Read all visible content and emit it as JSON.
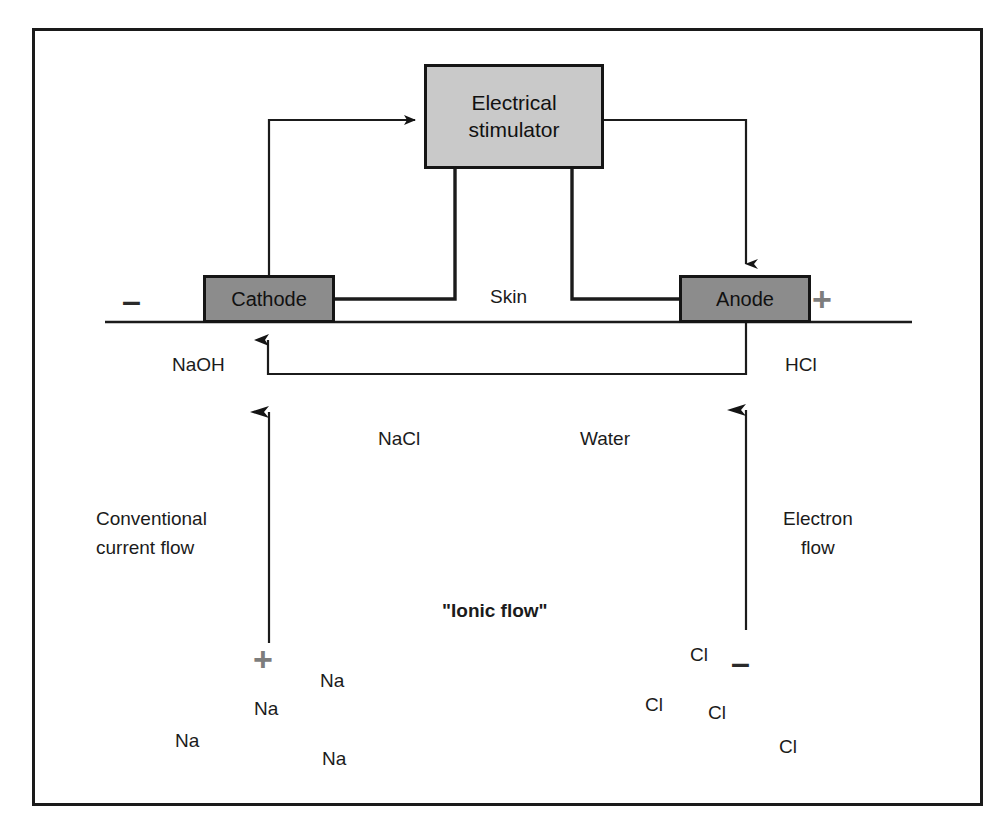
{
  "diagram": {
    "boxes": {
      "stimulator": {
        "label": "Electrical\nstimulator",
        "fill": "#c9c9c9",
        "stroke": "#151515"
      },
      "cathode": {
        "label": "Cathode",
        "fill": "#8c8c8c",
        "stroke": "#151515"
      },
      "anode": {
        "label": "Anode",
        "fill": "#8c8c8c",
        "stroke": "#151515"
      }
    },
    "labels": {
      "skin": "Skin",
      "naoh": "NaOH",
      "hcl": "HCl",
      "nacl": "NaCl",
      "water": "Water",
      "conventional_current_flow": "Conventional\ncurrent flow",
      "electron_flow": "Electron\nflow",
      "ionic_flow": "\"Ionic flow\""
    },
    "signs": {
      "cathode_polarity": "–",
      "anode_polarity": "+",
      "sodium_charge": "+",
      "chloride_charge": "–"
    },
    "ions": {
      "sodium": [
        "Na",
        "Na",
        "Na",
        "Na"
      ],
      "chloride": [
        "Cl",
        "Cl",
        "Cl",
        "Cl"
      ]
    },
    "colors": {
      "line": "#1b1b1b",
      "frame": "#1a1a1a",
      "electrode_fill": "#8c8c8c",
      "stimulator_fill": "#c9c9c9",
      "gray_sign": "#7d7d7d",
      "dark_sign": "#2a2a2a",
      "background": "#ffffff"
    }
  }
}
